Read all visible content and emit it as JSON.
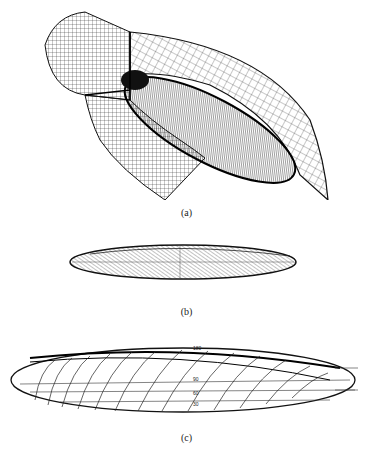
{
  "figure": {
    "panels": [
      {
        "id": "a",
        "caption": "(a)",
        "description": "3D wireframe computational mesh around an ellipsoid body, showing cylindrical and curved outer grid blocks"
      },
      {
        "id": "b",
        "caption": "(b)",
        "description": "Side view of ellipsoid with dense hatched surface mesh"
      },
      {
        "id": "c",
        "caption": "(c)",
        "description": "Ellipsoid outline with helical/streamline curves and angle labels"
      }
    ],
    "panel_c_labels": [
      "180",
      "90",
      "60",
      "30"
    ]
  }
}
